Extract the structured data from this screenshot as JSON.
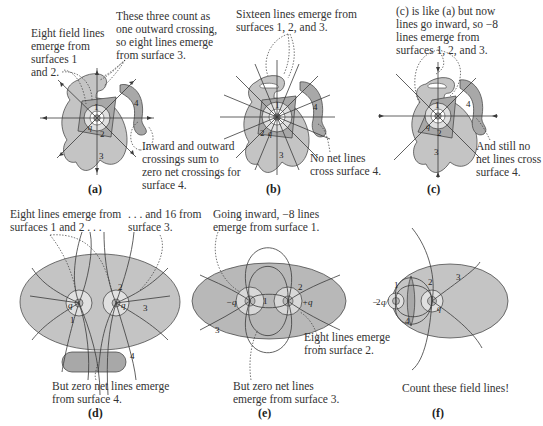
{
  "figure": {
    "colors": {
      "surface_dark": "#a8a8a8",
      "surface_mid": "#c4c4c4",
      "surface_light": "#d6d6d6",
      "line": "#3a3a3a",
      "annotation_dotted": "#3a3a3a"
    },
    "panels": [
      {
        "id": "a",
        "label": "(a)",
        "annotations": [
          [
            "Eight field lines",
            "emerge from",
            "surfaces 1",
            "and 2."
          ],
          [
            "These three count as",
            "one outward crossing,",
            "so eight lines emerge",
            "from surface 3."
          ],
          [
            "Inward and outward",
            "crossings sum to",
            "zero net crossings for",
            "surface 4."
          ]
        ],
        "surface_numbers": [
          "1",
          "2",
          "3",
          "4"
        ],
        "charge_labels": [
          "q",
          "+"
        ]
      },
      {
        "id": "b",
        "label": "(b)",
        "annotations": [
          [
            "Sixteen lines emerge from",
            "surfaces 1, 2, and 3."
          ],
          [
            "No net lines",
            "cross surface 4."
          ]
        ],
        "surface_numbers": [
          "1",
          "2",
          "3",
          "4"
        ],
        "charge_labels": [
          "2q",
          "+"
        ]
      },
      {
        "id": "c",
        "label": "(c)",
        "annotations": [
          [
            "(c) is like (a) but now",
            "lines go inward, so −8",
            "lines emerge from",
            "surfaces 1, 2, and 3."
          ],
          [
            "And still no",
            "net lines cross",
            "surface 4."
          ]
        ],
        "surface_numbers": [
          "1",
          "2",
          "3",
          "4"
        ],
        "charge_labels": [
          "q",
          "−"
        ]
      },
      {
        "id": "d",
        "label": "(d)",
        "annotations": [
          [
            "Eight lines emerge from",
            "surfaces 1 and 2 . . ."
          ],
          [
            ". . . and 16 from",
            "surface 3."
          ],
          [
            "But zero net lines emerge",
            "from surface 4."
          ]
        ],
        "surface_numbers": [
          "1",
          "2",
          "3",
          "4"
        ],
        "charge_labels": [
          "q",
          "+",
          "+",
          "q"
        ]
      },
      {
        "id": "e",
        "label": "(e)",
        "annotations": [
          [
            "Going inward, −8 lines",
            "emerge from surface 1."
          ],
          [
            "Eight lines emerge",
            "from surface 2."
          ],
          [
            "But zero net lines",
            "emerge from surface 3."
          ]
        ],
        "surface_numbers": [
          "1",
          "2",
          "3"
        ],
        "charge_labels": [
          "−q",
          "−",
          "+",
          "+q"
        ]
      },
      {
        "id": "f",
        "label": "(f)",
        "annotations": [
          [
            "Count these field lines!"
          ]
        ],
        "surface_numbers": [
          "1",
          "2",
          "3",
          "4"
        ],
        "charge_labels": [
          "−q/2",
          "q",
          "+"
        ]
      }
    ]
  }
}
